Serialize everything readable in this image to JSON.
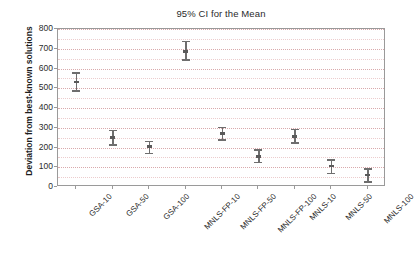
{
  "chart_data": {
    "type": "scatter",
    "title": "95% CI for the Mean",
    "xlabel": "",
    "ylabel": "Deviation from best-known solutions",
    "ylim": [
      0,
      800
    ],
    "ytick_labels": [
      "0",
      "100",
      "200",
      "300",
      "400",
      "500",
      "600",
      "700",
      "800"
    ],
    "ytick_values": [
      0,
      100,
      200,
      300,
      400,
      500,
      600,
      700,
      800
    ],
    "grid": true,
    "grid_minor_step": 50,
    "legend": "none",
    "categories": [
      "GSA-10",
      "GSA-50",
      "GSA-100",
      "MNLS-FP-10",
      "MNLS-FP-50",
      "MNLS-FP-100",
      "MNLS-10",
      "MNLS-50",
      "MNLS-100"
    ],
    "series": [
      {
        "name": "Mean",
        "values": [
          533,
          250,
          205,
          687,
          270,
          155,
          255,
          105,
          60
        ]
      },
      {
        "name": "CI lower",
        "values": [
          483,
          210,
          165,
          640,
          235,
          120,
          220,
          65,
          20
        ]
      },
      {
        "name": "CI upper",
        "values": [
          580,
          290,
          235,
          740,
          305,
          190,
          295,
          140,
          95
        ]
      }
    ],
    "marker_color": "#6e6e6e",
    "gridline_color": "#e2b9bb",
    "axis_color": "#9a9a9a"
  }
}
